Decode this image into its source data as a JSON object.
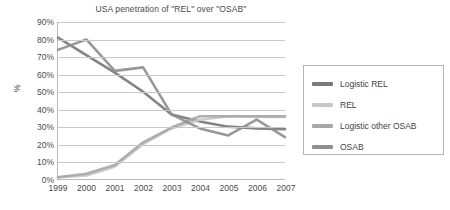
{
  "chart_data": {
    "type": "line",
    "title": "USA penetration of \"REL\" over \"OSAB\"",
    "xlabel": "",
    "ylabel": "%",
    "categories": [
      "1999",
      "2000",
      "2001",
      "2002",
      "2003",
      "2004",
      "2005",
      "2006",
      "2007"
    ],
    "ylim": [
      0,
      90
    ],
    "ytick_labels": [
      "0%",
      "10%",
      "20%",
      "30%",
      "40%",
      "50%",
      "60%",
      "70%",
      "80%",
      "90%"
    ],
    "ytick_values": [
      0,
      10,
      20,
      30,
      40,
      50,
      60,
      70,
      80,
      90
    ],
    "grid": true,
    "legend_position": "right",
    "series": [
      {
        "name": "Logistic REL",
        "color": "#7a7a7a",
        "values": [
          81,
          71,
          61,
          50,
          37,
          33,
          30,
          29,
          28.5
        ]
      },
      {
        "name": "REL",
        "color": "#c8c8c8",
        "values": [
          1,
          2,
          7,
          20,
          29,
          34,
          36,
          35.5,
          35.5
        ]
      },
      {
        "name": "Logistic other OSAB",
        "color": "#a8a8a8",
        "values": [
          1,
          3,
          8,
          21,
          29.5,
          36,
          36,
          36,
          36
        ]
      },
      {
        "name": "OSAB",
        "color": "#8f8f8f",
        "values": [
          74,
          80,
          62,
          64,
          37,
          29,
          25,
          34,
          24
        ]
      }
    ]
  }
}
